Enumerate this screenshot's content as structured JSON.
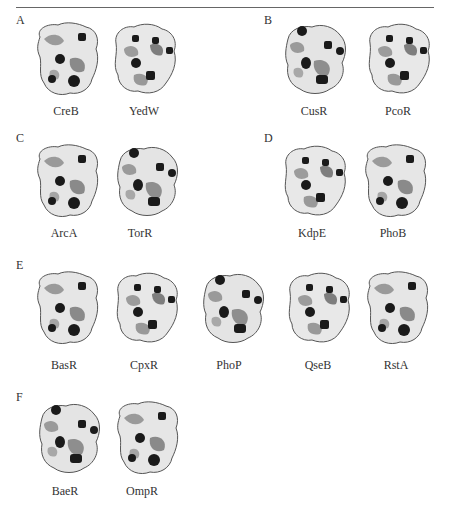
{
  "page": {
    "header_text": "",
    "caption_text": ""
  },
  "panels": [
    {
      "letter": "A",
      "proteins": [
        "CreB",
        "YedW"
      ]
    },
    {
      "letter": "B",
      "proteins": [
        "CusR",
        "PcoR"
      ]
    },
    {
      "letter": "C",
      "proteins": [
        "ArcA",
        "TorR"
      ]
    },
    {
      "letter": "D",
      "proteins": [
        "KdpE",
        "PhoB"
      ]
    },
    {
      "letter": "E",
      "proteins": [
        "BasR",
        "CpxR",
        "PhoP",
        "QseB",
        "RstA"
      ]
    },
    {
      "letter": "F",
      "proteins": [
        "BaeR",
        "OmpR"
      ]
    }
  ],
  "colors": {
    "surface_light": "#e8e8e8",
    "surface_mid": "#9a9a9a",
    "surface_dark": "#6e6e6e",
    "hotspot": "#1a1a1a",
    "outline": "#555555"
  }
}
